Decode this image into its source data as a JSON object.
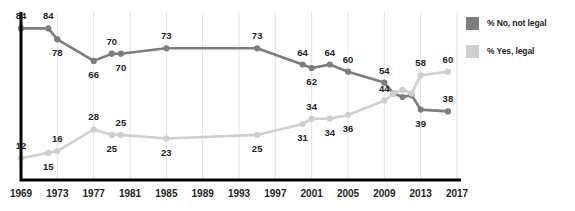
{
  "legend": {
    "position": "right",
    "items": [
      {
        "label": "% No, not legal",
        "color": "#7d7d7d",
        "name": "no-not-legal"
      },
      {
        "label": "% Yes, legal",
        "color": "#cfcfcf",
        "name": "yes-legal"
      }
    ]
  },
  "axis": {
    "x_ticks": [
      "1969",
      "1973",
      "1977",
      "1981",
      "1985",
      "1989",
      "1993",
      "1997",
      "2001",
      "2005",
      "2009",
      "2013",
      "2017"
    ],
    "axis_color": "#000000",
    "grid_color": "#e2e2e2"
  },
  "chart_data": {
    "type": "line",
    "title": "",
    "subtitle": "",
    "xlabel": "",
    "ylabel": "",
    "grid": true,
    "legend_position": "right",
    "xlim": [
      1969,
      2017
    ],
    "ylim": [
      0,
      92
    ],
    "x_tick_labels": [
      "1969",
      "1973",
      "1977",
      "1981",
      "1985",
      "1989",
      "1993",
      "1997",
      "2001",
      "2005",
      "2009",
      "2013",
      "2017"
    ],
    "x": [
      1969,
      1972,
      1973,
      1977,
      1979,
      1980,
      1985,
      1995,
      2000,
      2001,
      2003,
      2005,
      2009,
      2010,
      2011,
      2012,
      2013,
      2016
    ],
    "series": [
      {
        "name": "% No, not legal",
        "color": "#7d7d7d",
        "values": [
          84,
          84,
          78,
          66,
          70,
          70,
          73,
          73,
          64,
          62,
          64,
          60,
          54,
          48,
          46,
          47,
          39,
          38
        ],
        "point_labels": [
          "84",
          "84",
          "78",
          "66",
          "70",
          "70",
          "73",
          "73",
          "64",
          "62",
          "64",
          "60",
          "54",
          "",
          "",
          "",
          "39",
          "38"
        ],
        "label_positions": [
          "above",
          "above",
          "below",
          "below",
          "above",
          "below",
          "above",
          "above",
          "above",
          "below",
          "above",
          "above",
          "above",
          "",
          "",
          "",
          "below",
          "above"
        ]
      },
      {
        "name": "% Yes, legal",
        "color": "#cfcfcf",
        "values": [
          12,
          15,
          16,
          28,
          25,
          25,
          23,
          25,
          31,
          34,
          34,
          36,
          44,
          48,
          50,
          48,
          58,
          60
        ],
        "point_labels": [
          "12",
          "15",
          "16",
          "28",
          "25",
          "25",
          "23",
          "25",
          "31",
          "34",
          "34",
          "36",
          "44",
          "",
          "",
          "",
          "58",
          "60"
        ],
        "label_positions": [
          "above",
          "below",
          "above",
          "above",
          "below",
          "above",
          "below",
          "below",
          "below",
          "above",
          "below",
          "below",
          "above",
          "",
          "",
          "",
          "above",
          "above"
        ]
      }
    ]
  }
}
